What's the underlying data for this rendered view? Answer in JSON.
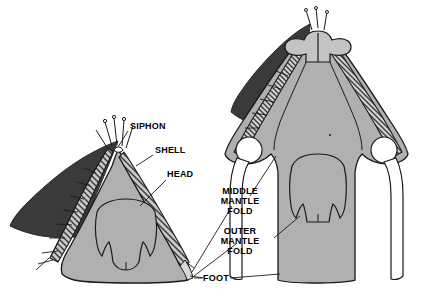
{
  "figure": {
    "background": "#ffffff",
    "colors": {
      "shell_dark": "#3a3a3a",
      "body_grey": "#b0b0b0",
      "outline": "#1a1a1a",
      "white": "#ffffff",
      "hatch": "#555555"
    }
  },
  "labels": [
    {
      "id": "siphon",
      "text": "SIPHON",
      "x": 130,
      "y": 126,
      "align": "left"
    },
    {
      "id": "shell",
      "text": "SHELL",
      "x": 155,
      "y": 150,
      "align": "left"
    },
    {
      "id": "head",
      "text": "HEAD",
      "x": 167,
      "y": 174,
      "align": "left"
    },
    {
      "id": "middle-mantle-fold",
      "text": "MIDDLE\nMANTLE\nFOLD",
      "x": 240,
      "y": 196,
      "align": "center"
    },
    {
      "id": "outer-mantle-fold",
      "text": "OUTER\nMANTLE\nFOLD",
      "x": 240,
      "y": 236,
      "align": "center"
    },
    {
      "id": "foot",
      "text": "FOOT",
      "x": 216,
      "y": 278,
      "align": "center"
    }
  ],
  "specimens": [
    {
      "id": "left-specimen",
      "name": "contracted mantle specimen",
      "position": "left"
    },
    {
      "id": "right-specimen",
      "name": "expanded mantle specimen",
      "position": "right"
    }
  ],
  "anatomy_parts": [
    "siphon",
    "shell",
    "head",
    "middle mantle fold",
    "outer mantle fold",
    "foot"
  ]
}
